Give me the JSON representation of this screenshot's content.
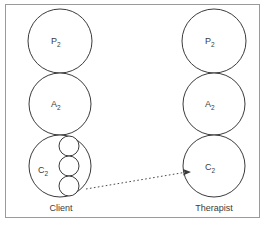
{
  "diagram": {
    "background_color": "#ffffff",
    "frame_color": "#9a9a9a",
    "stroke_color": "#3b3b3b",
    "columns": [
      {
        "id": "client",
        "label": "Client",
        "label_x": 61,
        "label_y": 211,
        "center_x": 60,
        "states": [
          {
            "id": "client-parent",
            "letter": "P",
            "subscript": "2",
            "cx": 60,
            "cy": 41,
            "r": 32,
            "label_x": 51,
            "label_y": 44
          },
          {
            "id": "client-adult",
            "letter": "A",
            "subscript": "2",
            "cx": 60,
            "cy": 104,
            "r": 31,
            "label_x": 51,
            "label_y": 107
          },
          {
            "id": "client-child",
            "letter": "C",
            "subscript": "2",
            "cx": 60,
            "cy": 166,
            "r": 31,
            "label_x": 38,
            "label_y": 173
          }
        ],
        "inner_circles": [
          {
            "id": "client-child-inner-1",
            "cx": 69,
            "cy": 146,
            "r": 10
          },
          {
            "id": "client-child-inner-2",
            "cx": 69,
            "cy": 166,
            "r": 10
          },
          {
            "id": "client-child-inner-3",
            "cx": 69,
            "cy": 186,
            "r": 10
          }
        ]
      },
      {
        "id": "therapist",
        "label": "Therapist",
        "label_x": 214,
        "label_y": 211,
        "center_x": 214,
        "states": [
          {
            "id": "therapist-parent",
            "letter": "P",
            "subscript": "2",
            "cx": 214,
            "cy": 41,
            "r": 32,
            "label_x": 205,
            "label_y": 44
          },
          {
            "id": "therapist-adult",
            "letter": "A",
            "subscript": "2",
            "cx": 214,
            "cy": 104,
            "r": 31,
            "label_x": 205,
            "label_y": 107
          },
          {
            "id": "therapist-child",
            "letter": "C",
            "subscript": "2",
            "cx": 214,
            "cy": 166,
            "r": 31,
            "label_x": 205,
            "label_y": 170
          }
        ],
        "inner_circles": []
      }
    ],
    "transaction_arrow": {
      "id": "client-child-to-therapist-child",
      "from_x": 86,
      "from_y": 189,
      "to_x": 186,
      "to_y": 172,
      "style": "dotted",
      "arrowhead": "right"
    }
  }
}
